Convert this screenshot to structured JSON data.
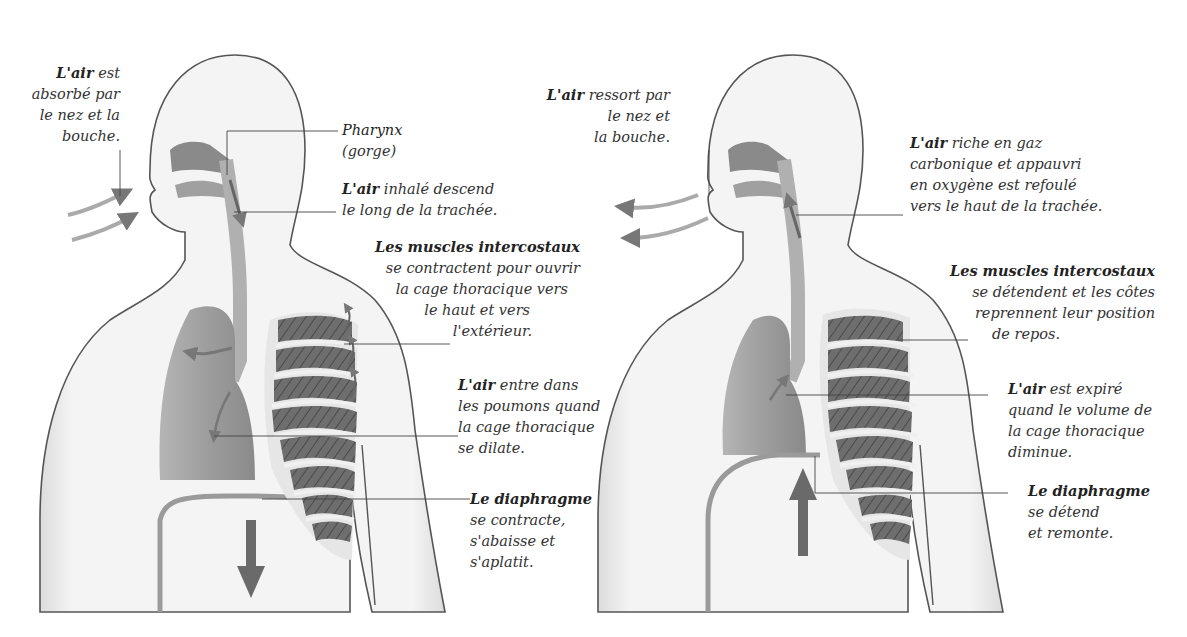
{
  "inspiration": {
    "label_air_in": {
      "lead": "L'air",
      "lines": [
        "est",
        "absorbé par",
        "le nez et la",
        "bouche."
      ]
    },
    "label_pharynx": {
      "lead": "Pharynx",
      "lines": [
        "(gorge)"
      ]
    },
    "label_trachea": {
      "lead": "L'air",
      "lines": [
        "inhalé descend",
        "le long de la trachée."
      ]
    },
    "label_intercostal": {
      "lead": "Les muscles intercostaux",
      "lines": [
        "se contractent pour ouvrir",
        "la cage thoracique vers",
        "le haut et vers",
        "l'extérieur."
      ]
    },
    "label_lungs": {
      "lead": "L'air",
      "lines": [
        "entre dans",
        "les poumons quand",
        "la cage thoracique",
        "se dilate."
      ]
    },
    "label_diaphragm": {
      "lead": "Le diaphragme",
      "lines": [
        "se contracte,",
        "s'abaisse et",
        "s'aplatit."
      ]
    },
    "diaphragm_arrow": "arrow-down-icon"
  },
  "expiration": {
    "label_air_out": {
      "lead": "L'air",
      "lines": [
        "ressort par",
        "le nez et",
        "la bouche."
      ]
    },
    "label_trachea": {
      "lead": "L'air",
      "lines": [
        "riche en gaz",
        "carbonique et appauvri",
        "en oxygène est refoulé",
        "vers le haut de la trachée."
      ]
    },
    "label_intercostal": {
      "lead": "Les muscles intercostaux",
      "lines": [
        "se détendent et les côtes",
        "reprennent leur position",
        "de repos."
      ]
    },
    "label_lungs": {
      "lead": "L'air",
      "lines": [
        "est expiré",
        "quand le volume de",
        "la cage thoracique",
        "diminue."
      ]
    },
    "label_diaphragm": {
      "lead": "Le diaphragme",
      "lines": [
        "se détend",
        "et remonte."
      ]
    },
    "diaphragm_arrow": "arrow-up-icon"
  },
  "colors": {
    "body_outline": "#555555",
    "lung_fill": "#9a9a9a",
    "muscle_fill": "#6a6a6a",
    "rib_fill": "#e4e4e4",
    "arrow_fill": "#777777",
    "leader_line": "#444444"
  }
}
